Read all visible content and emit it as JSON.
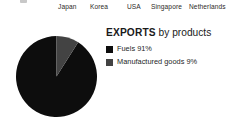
{
  "axis_labels": {
    "items": [
      {
        "label": "Japan",
        "x": 58
      },
      {
        "label": "Korea",
        "x": 90
      },
      {
        "label": "USA",
        "x": 127
      },
      {
        "label": "Singapore",
        "x": 151
      },
      {
        "label": "Netherlands",
        "x": 189
      }
    ]
  },
  "chart_data": {
    "type": "pie",
    "title": "EXPORTS by products",
    "title_strong": "EXPORTS",
    "title_rest": " by products",
    "xlabel": "",
    "ylabel": "",
    "start_angle_deg": 0,
    "direction": "counterclockwise",
    "legend_position": "right",
    "grid": false,
    "categories": [
      "Fuels",
      "Manufactured goods"
    ],
    "values": [
      91,
      9
    ],
    "labels": [
      "Fuels 91%",
      "Manufactured goods 9%"
    ],
    "slices": [
      {
        "name": "Fuels",
        "value": 91,
        "label": "Fuels 91%",
        "color": "#0d0d0d"
      },
      {
        "name": "Manufactured goods",
        "value": 9,
        "label": "Manufactured goods 9%",
        "color": "#434343"
      }
    ]
  },
  "colors": {
    "background": "#ffffff",
    "fuels": "#0d0d0d",
    "manufactured": "#434343",
    "text": "#231f20"
  }
}
